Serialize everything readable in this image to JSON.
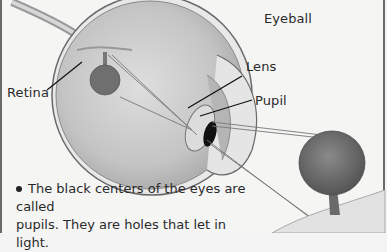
{
  "diagram": {
    "title": "Eyeball",
    "labels": {
      "retina": "Retina",
      "lens": "Lens",
      "pupil": "Pupil",
      "eyeball": "Eyeball"
    },
    "caption_line1": "The black centers of the eyes are called",
    "caption_line2": "pupils. They are holes that let in light.",
    "colors": {
      "background": "#f5f5f4",
      "eyeball_fill": "#c9c9c9",
      "pupil": "#111111",
      "tree_canopy": "#6e6e6e",
      "text": "#2a2a2a"
    }
  }
}
